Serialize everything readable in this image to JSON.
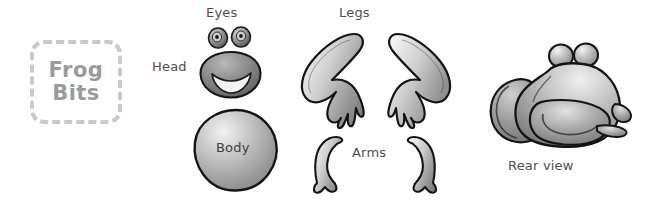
{
  "figure": {
    "title_badge": {
      "line1": "Frog",
      "line2": "Bits"
    },
    "background_color": "#ffffff",
    "ink_color": "#4f4f4f",
    "badge_border_color": "#c9c9c9",
    "badge_text_color": "#9b9b9b",
    "part_fill_light": "#e8e8e8",
    "part_fill_mid": "#9a9a9a",
    "part_fill_dark": "#6b6b6b",
    "outline_color": "#1a1a1a"
  },
  "labels": {
    "eyes": "Eyes",
    "head": "Head",
    "body": "Body",
    "legs": "Legs",
    "arms": "Arms",
    "rear_view": "Rear view"
  },
  "parts": [
    {
      "name": "eyes",
      "label": "Eyes",
      "count": 2,
      "shape": "small spheres with pupils"
    },
    {
      "name": "head",
      "label": "Head",
      "count": 1,
      "shape": "rounded blob with smile"
    },
    {
      "name": "body",
      "label": "Body",
      "count": 1,
      "shape": "large sphere"
    },
    {
      "name": "legs",
      "label": "Legs",
      "count": 2,
      "shape": "folded zigzag with three toes"
    },
    {
      "name": "arms",
      "label": "Arms",
      "count": 2,
      "shape": "curved crescent with hand"
    }
  ],
  "assembled": {
    "caption": "Rear view",
    "description": "assembled frog seen from behind"
  }
}
